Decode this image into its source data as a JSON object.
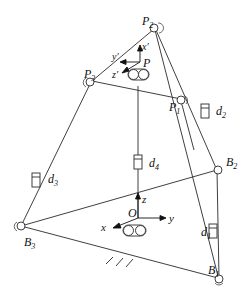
{
  "diagram": {
    "type": "parallel-mechanism-schematic",
    "colors": {
      "line": "#2a2a2a",
      "background": "#ffffff"
    },
    "joints": {
      "P1": {
        "label": "P",
        "sub": "1"
      },
      "P2": {
        "label": "P",
        "sub": "2"
      },
      "P3": {
        "label": "P",
        "sub": "3"
      },
      "B1": {
        "label": "B",
        "sub": "1"
      },
      "B2": {
        "label": "B",
        "sub": "2"
      },
      "B3": {
        "label": "B",
        "sub": "3"
      }
    },
    "actuators": {
      "d1": {
        "label": "d",
        "sub": "1"
      },
      "d2": {
        "label": "d",
        "sub": "2"
      },
      "d3": {
        "label": "d",
        "sub": "3"
      },
      "d4": {
        "label": "d",
        "sub": "4"
      }
    },
    "moving_frame": {
      "origin": "P",
      "x": "x′",
      "y": "y′",
      "z": "z′"
    },
    "base_frame": {
      "origin": "O",
      "x": "x",
      "y": "y",
      "z": "z"
    }
  }
}
